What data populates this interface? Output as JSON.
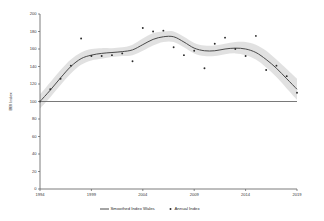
{
  "chart_data": {
    "type": "line",
    "title": "",
    "xlabel": "",
    "ylabel": "BBI Index",
    "xlim": [
      1994,
      2019
    ],
    "ylim": [
      0,
      200
    ],
    "grid": false,
    "legend_position": "bottom",
    "x_ticks": [
      "1994",
      "1999",
      "2004",
      "2009",
      "2014",
      "2019"
    ],
    "y_ticks": [
      "0",
      "20",
      "40",
      "60",
      "80",
      "100",
      "120",
      "140",
      "160",
      "180",
      "200"
    ],
    "reference_line": {
      "y": 100,
      "label": ""
    },
    "series": [
      {
        "name": "Smoothed Index Wales",
        "type": "line",
        "x": [
          1994,
          1995,
          1996,
          1997,
          1998,
          1999,
          2000,
          2001,
          2002,
          2003,
          2004,
          2005,
          2006,
          2007,
          2008,
          2009,
          2010,
          2011,
          2012,
          2013,
          2014,
          2015,
          2016,
          2017,
          2018,
          2019
        ],
        "values": [
          100,
          113,
          127,
          140,
          149,
          153,
          155,
          156,
          157,
          159,
          165,
          171,
          174,
          174,
          168,
          161,
          158,
          158,
          160,
          161,
          160,
          156,
          148,
          138,
          126,
          114
        ]
      },
      {
        "name": "Annual Index",
        "type": "scatter",
        "x": [
          1994,
          1995,
          1996,
          1997,
          1998,
          1999,
          2000,
          2001,
          2002,
          2003,
          2004,
          2005,
          2006,
          2007,
          2008,
          2009,
          2010,
          2011,
          2012,
          2013,
          2014,
          2015,
          2016,
          2017,
          2018,
          2019
        ],
        "values": [
          100,
          114,
          126,
          141,
          172,
          152,
          152,
          153,
          155,
          146,
          184,
          180,
          181,
          162,
          153,
          158,
          138,
          166,
          173,
          160,
          152,
          175,
          136,
          141,
          129,
          110
        ]
      }
    ],
    "confidence_band": {
      "name": "Smoothed Index Wales confidence interval",
      "x": [
        1994,
        1995,
        1996,
        1997,
        1998,
        1999,
        2000,
        2001,
        2002,
        2003,
        2004,
        2005,
        2006,
        2007,
        2008,
        2009,
        2010,
        2011,
        2012,
        2013,
        2014,
        2015,
        2016,
        2017,
        2018,
        2019
      ],
      "upper": [
        108,
        122,
        136,
        148,
        156,
        160,
        161,
        161,
        162,
        165,
        172,
        178,
        180,
        180,
        174,
        167,
        164,
        164,
        166,
        168,
        168,
        165,
        158,
        148,
        137,
        126
      ],
      "lower": [
        92,
        105,
        119,
        132,
        142,
        147,
        149,
        151,
        152,
        153,
        158,
        164,
        168,
        168,
        162,
        155,
        152,
        152,
        154,
        155,
        153,
        148,
        139,
        128,
        115,
        102
      ]
    }
  },
  "legend": {
    "items": [
      {
        "label": "Smoothed Index Wales",
        "marker": "line"
      },
      {
        "label": "Annual Index",
        "marker": "dot"
      }
    ]
  }
}
